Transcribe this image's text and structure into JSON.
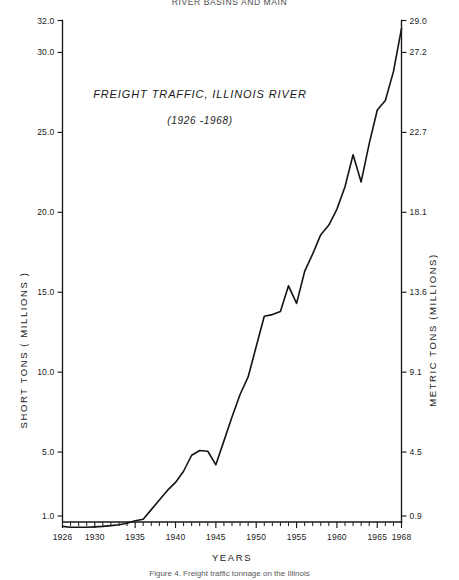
{
  "header": {
    "text": "RIVER BASINS AND MAIN"
  },
  "caption": {
    "text": "Figure 4.  Freight traffic tonnage on the Illinois"
  },
  "chart_data": {
    "type": "line",
    "title": "FREIGHT TRAFFIC, ILLINOIS RIVER",
    "subtitle": "(1926 -1968)",
    "xlabel": "YEARS",
    "ylabel": "SHORT TONS ( MILLIONS )",
    "y2label": "METRIC TONS (MILLIONS)",
    "grid": false,
    "legend": "none",
    "xlim": [
      1926,
      1968
    ],
    "ylim": [
      0,
      32.0
    ],
    "y2lim": [
      0,
      29.0
    ],
    "xticklabels": [
      "1926",
      "1930",
      "1935",
      "1940",
      "1945",
      "1950",
      "1955",
      "1960",
      "1965",
      "1968"
    ],
    "xtickvalues": [
      1926,
      1930,
      1935,
      1940,
      1945,
      1950,
      1955,
      1960,
      1965,
      1968
    ],
    "yticklabels": [
      "1.0",
      "5.0",
      "10.0",
      "15.0",
      "20.0",
      "25.0",
      "30.0",
      "32.0"
    ],
    "ytickvalues": [
      1.0,
      5.0,
      10.0,
      15.0,
      20.0,
      25.0,
      30.0,
      32.0
    ],
    "y2ticklabels": [
      "0.9",
      "4.5",
      "9.1",
      "13.6",
      "18.1",
      "22.7",
      "27.2",
      "29.0"
    ],
    "y2tickvalues": [
      0.9,
      4.5,
      9.1,
      13.6,
      18.1,
      22.7,
      27.2,
      29.0
    ],
    "x": [
      1926,
      1927,
      1928,
      1929,
      1930,
      1931,
      1932,
      1933,
      1934,
      1935,
      1936,
      1937,
      1938,
      1939,
      1940,
      1941,
      1942,
      1943,
      1944,
      1945,
      1946,
      1947,
      1948,
      1949,
      1950,
      1951,
      1952,
      1953,
      1954,
      1955,
      1956,
      1957,
      1958,
      1959,
      1960,
      1961,
      1962,
      1963,
      1964,
      1965,
      1966,
      1967,
      1968
    ],
    "values": [
      0.35,
      0.3,
      0.3,
      0.3,
      0.32,
      0.35,
      0.4,
      0.45,
      0.55,
      0.7,
      0.8,
      1.4,
      2.0,
      2.6,
      3.1,
      3.8,
      4.8,
      5.1,
      5.05,
      4.2,
      5.7,
      7.2,
      8.6,
      9.7,
      11.6,
      13.5,
      13.6,
      13.8,
      15.4,
      14.3,
      16.3,
      17.4,
      18.6,
      19.2,
      20.2,
      21.6,
      23.6,
      21.9,
      24.3,
      26.4,
      27.0,
      28.8,
      31.5
    ],
    "series_name": "Illinois River freight tonnage"
  }
}
